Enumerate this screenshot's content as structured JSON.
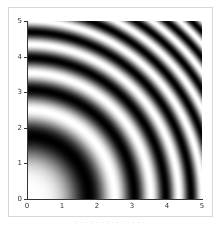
{
  "chart_data": {
    "type": "heatmap",
    "title": "",
    "function": "cos(x^2 + y^2)",
    "colormap": "gray",
    "xlabel": "",
    "ylabel": "",
    "xlim": [
      0,
      5
    ],
    "ylim": [
      0,
      5
    ],
    "x_ticks": [
      "0",
      "1",
      "2",
      "3",
      "4",
      "5"
    ],
    "y_ticks": [
      "0",
      "1",
      "2",
      "3",
      "4",
      "5"
    ],
    "grid": false,
    "legend": null,
    "bright_radii": [
      0,
      2.51,
      3.54,
      4.34,
      5.01
    ],
    "dark_radii": [
      1.77,
      3.07,
      3.96,
      4.69
    ]
  },
  "caption": "· · · · · · · · · · · · · ·"
}
